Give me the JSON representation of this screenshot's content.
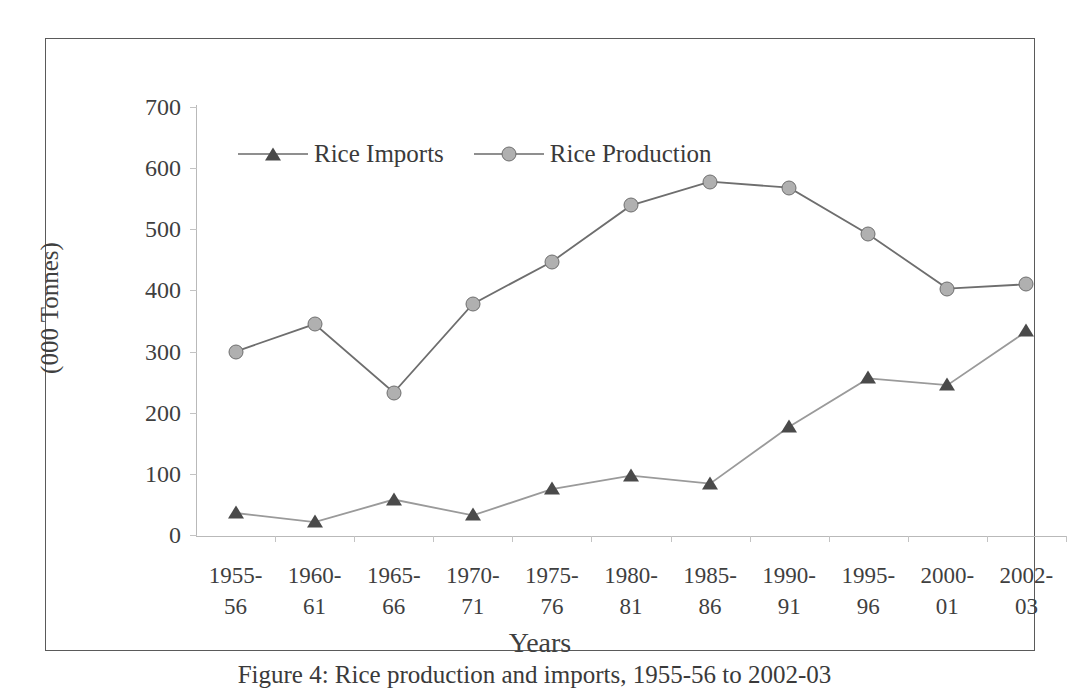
{
  "figure": {
    "caption": "Figure 4:  Rice production and imports, 1955-56 to 2002-03"
  },
  "chart_data": {
    "type": "line",
    "title": "",
    "xlabel": "Years",
    "ylabel": "(000 Tonnes)",
    "ylim": [
      0,
      700
    ],
    "ytick_step": 100,
    "yticks": [
      "700",
      "600",
      "500",
      "400",
      "300",
      "200",
      "100",
      "0"
    ],
    "ytick_values": [
      700,
      600,
      500,
      400,
      300,
      200,
      100,
      0
    ],
    "grid": false,
    "legend_position": "top-center",
    "categories": [
      "1955-\n56",
      "1960-\n61",
      "1965-\n66",
      "1970-\n71",
      "1975-\n76",
      "1980-\n81",
      "1985-\n86",
      "1990-\n91",
      "1995-\n96",
      "2000-\n01",
      "2002-\n03"
    ],
    "categories_line1": [
      "1955-",
      "1960-",
      "1965-",
      "1970-",
      "1975-",
      "1980-",
      "1985-",
      "1990-",
      "1995-",
      "2000-",
      "2002-"
    ],
    "categories_line2": [
      "56",
      "61",
      "66",
      "71",
      "76",
      "81",
      "86",
      "91",
      "96",
      "01",
      "03"
    ],
    "series": [
      {
        "name": "Rice Imports",
        "marker": "triangle",
        "color": "#4a4a4a",
        "line_color": "#9a9a9a",
        "values": [
          36,
          21,
          58,
          32,
          75,
          97,
          84,
          177,
          256,
          245,
          333
        ]
      },
      {
        "name": "Rice Production",
        "marker": "circle",
        "color": "#b0b0b0",
        "line_color": "#6e6e6e",
        "values": [
          300,
          345,
          233,
          378,
          447,
          539,
          578,
          568,
          492,
          403,
          410
        ]
      }
    ]
  },
  "colors": {
    "frame": "#5a5a5a",
    "axis": "#b9b9b9",
    "text": "#3a3a3a",
    "imports_line": "#9a9a9a",
    "imports_marker": "#4a4a4a",
    "production_line": "#6e6e6e",
    "production_marker": "#b0b0b0"
  }
}
